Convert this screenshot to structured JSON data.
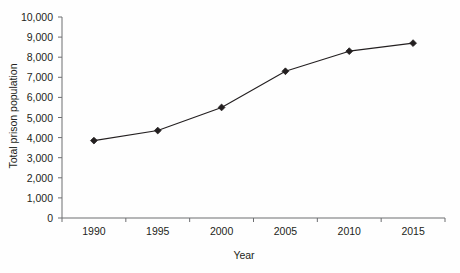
{
  "chart_data": {
    "type": "line",
    "title": "",
    "xlabel": "Year",
    "ylabel": "Total prison population",
    "x": [
      1990,
      1995,
      2000,
      2005,
      2010,
      2015
    ],
    "categories": [
      "1990",
      "1995",
      "2000",
      "2005",
      "2010",
      "2015"
    ],
    "values": [
      3850,
      4350,
      5500,
      7300,
      8300,
      8700
    ],
    "series": [
      {
        "name": "Total prison population",
        "values": [
          3850,
          4350,
          5500,
          7300,
          8300,
          8700
        ]
      }
    ],
    "xlim": [
      1987.5,
      2017.5
    ],
    "ylim": [
      0,
      10000
    ],
    "ytick_values": [
      0,
      1000,
      2000,
      3000,
      4000,
      5000,
      6000,
      7000,
      8000,
      9000,
      10000
    ],
    "ytick_labels": [
      "0",
      "1,000",
      "2,000",
      "3,000",
      "4,000",
      "5,000",
      "6,000",
      "7,000",
      "8,000",
      "9,000",
      "10,000"
    ],
    "xtick_labels": [
      "1990",
      "1995",
      "2000",
      "2005",
      "2010",
      "2015"
    ],
    "grid": false,
    "legend": false,
    "legend_position": "none",
    "marker": "diamond",
    "line_color": "#231f20",
    "marker_color": "#231f20",
    "axis_color": "#6d6e71",
    "background_color": "#ffffff"
  }
}
